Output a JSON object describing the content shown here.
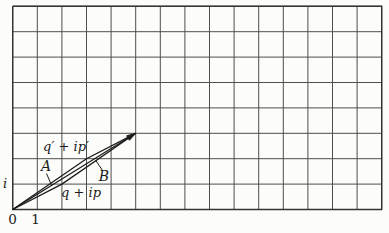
{
  "labels": {
    "i": "i",
    "zero": "0",
    "one": "1",
    "q_prime_point": "q′ + ip′",
    "q_point": "q + ip",
    "A": "A",
    "B": "B"
  },
  "figure": {
    "canvas": {
      "width": 389,
      "height": 233
    },
    "grid": {
      "x_start": 12.7,
      "x_step": 24.6,
      "x_count": 16,
      "y_start": 6.3,
      "y_step": 25.4,
      "y_count": 9,
      "color": "#4e4e4e",
      "border_color": "#333333"
    },
    "stroke": "#1c1c1c",
    "points": {
      "origin": [
        12.7,
        209.5
      ],
      "q_ip": [
        61.9,
        184.1
      ],
      "qprime_ipprime": [
        86.5,
        158.7
      ],
      "sum": [
        135.7,
        133.3
      ]
    },
    "leaders": {
      "A": [
        [
          46.5,
          173.5
        ],
        [
          51.5,
          185.2
        ]
      ],
      "B": [
        [
          102.5,
          170.5
        ],
        [
          95.5,
          160.0
        ]
      ]
    },
    "arrowhead": {
      "length": 9,
      "half_width": 2.6
    }
  }
}
